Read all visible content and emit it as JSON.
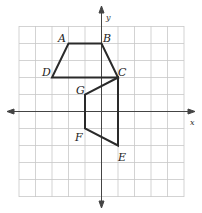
{
  "diagram": {
    "type": "coordinate-grid",
    "grid": {
      "xmin": -5,
      "xmax": 5,
      "ymin": -5,
      "ymax": 5,
      "color": "#c8c8c8"
    },
    "axes": {
      "x_label": "x",
      "y_label": "y",
      "color": "#444444"
    },
    "shapes": [
      {
        "name": "trapezoid-ABCD",
        "vertices": [
          {
            "label": "A",
            "x": -2,
            "y": 4
          },
          {
            "label": "B",
            "x": 0,
            "y": 4
          },
          {
            "label": "C",
            "x": 1,
            "y": 2
          },
          {
            "label": "D",
            "x": -3,
            "y": 2
          }
        ]
      },
      {
        "name": "trapezoid-CEFG",
        "vertices": [
          {
            "label": "C",
            "x": 1,
            "y": 2
          },
          {
            "label": "E",
            "x": 1,
            "y": -2
          },
          {
            "label": "F",
            "x": -1,
            "y": -1
          },
          {
            "label": "G",
            "x": -1,
            "y": 1
          }
        ]
      }
    ],
    "labels": {
      "A": "A",
      "B": "B",
      "C": "C",
      "D": "D",
      "E": "E",
      "F": "F",
      "G": "G"
    },
    "stroke_color": "#2a2a2a"
  }
}
